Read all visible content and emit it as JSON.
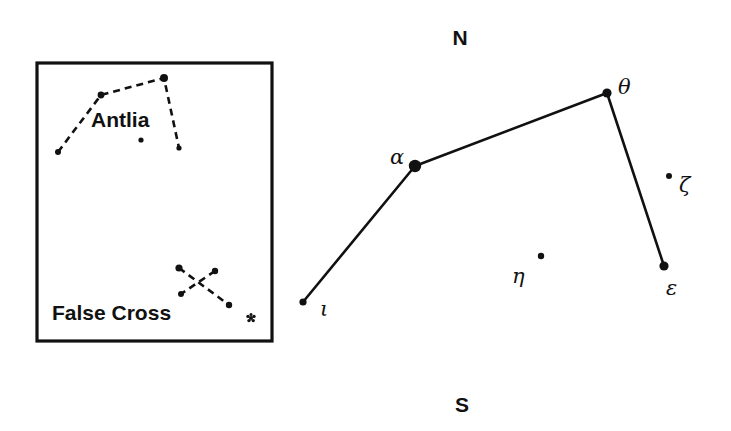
{
  "figure": {
    "kind": "star-chart",
    "background_color": "#ffffff",
    "ink_color": "#111111",
    "width": 731,
    "height": 431
  },
  "compass": {
    "north_label": "N",
    "north_x": 460,
    "north_y": 45,
    "south_label": "S",
    "south_y": 412,
    "south_x": 462
  },
  "main_chart": {
    "name": "vela-main-asterism",
    "stars": [
      {
        "id": "iota",
        "label": "ι",
        "x": 303,
        "y": 302,
        "r": 3.6,
        "label_x": 320,
        "label_y": 316
      },
      {
        "id": "alpha",
        "label": "α",
        "x": 415,
        "y": 166,
        "r": 6.2,
        "label_x": 390,
        "label_y": 164
      },
      {
        "id": "theta",
        "label": "θ",
        "x": 607,
        "y": 93,
        "r": 4.6,
        "label_x": 618,
        "label_y": 94
      },
      {
        "id": "epsilon",
        "label": "ε",
        "x": 664,
        "y": 266,
        "r": 4.6,
        "label_x": 666,
        "label_y": 295
      },
      {
        "id": "zeta",
        "label": "ζ",
        "x": 669,
        "y": 176,
        "r": 3.0,
        "label_x": 679,
        "label_y": 192
      },
      {
        "id": "eta",
        "label": "η",
        "x": 541,
        "y": 256,
        "r": 3.2,
        "label_x": 512,
        "label_y": 283
      }
    ],
    "connections": [
      {
        "from": "iota",
        "to": "alpha",
        "width": 2.6
      },
      {
        "from": "alpha",
        "to": "theta",
        "width": 2.6
      },
      {
        "from": "theta",
        "to": "epsilon",
        "width": 2.6
      }
    ]
  },
  "inset": {
    "name": "inset-panel",
    "frame": {
      "x": 37,
      "y": 63,
      "width": 235,
      "height": 278
    },
    "antlia": {
      "label": "Antlia",
      "label_x": 91,
      "label_y": 127,
      "stars": [
        {
          "id": "antlia-sw",
          "x": 58,
          "y": 152,
          "r": 3.0
        },
        {
          "id": "antlia-nw",
          "x": 101,
          "y": 95,
          "r": 3.4
        },
        {
          "id": "antlia-ne",
          "x": 164,
          "y": 78,
          "r": 4.0
        },
        {
          "id": "antlia-se",
          "x": 179,
          "y": 148,
          "r": 2.6
        },
        {
          "id": "antlia-mid",
          "x": 141,
          "y": 140,
          "r": 2.6
        }
      ],
      "path": [
        "antlia-sw",
        "antlia-nw",
        "antlia-ne",
        "antlia-se"
      ]
    },
    "false_cross": {
      "label": "False Cross",
      "label_x": 52,
      "label_y": 320,
      "stars": [
        {
          "id": "fc-tl",
          "x": 179,
          "y": 268,
          "r": 3.6
        },
        {
          "id": "fc-tr",
          "x": 215,
          "y": 271,
          "r": 3.2
        },
        {
          "id": "fc-bl",
          "x": 181,
          "y": 294,
          "r": 3.0
        },
        {
          "id": "fc-br",
          "x": 229,
          "y": 305,
          "r": 3.2
        }
      ],
      "strokes": [
        {
          "from": "fc-tl",
          "to": "fc-br"
        },
        {
          "from": "fc-tr",
          "to": "fc-bl"
        }
      ],
      "cluster_symbol": {
        "id": "open-cluster",
        "x": 251,
        "y": 318,
        "r": 4.0
      }
    }
  }
}
